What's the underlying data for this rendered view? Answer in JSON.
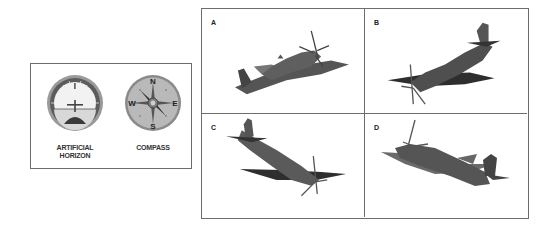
{
  "instruments": {
    "artificial_horizon": {
      "label": "ARTIFICIAL HORIZON",
      "label_line1": "ARTIFICIAL",
      "label_line2": "HORIZON",
      "icon": "artificial-horizon-icon"
    },
    "compass": {
      "label": "COMPASS",
      "icon": "compass-icon",
      "directions": {
        "n": "N",
        "e": "E",
        "s": "S",
        "w": "W"
      }
    }
  },
  "options": [
    {
      "label": "A",
      "icon": "airplane-icon",
      "attitude": "nose up, banked"
    },
    {
      "label": "B",
      "icon": "airplane-icon",
      "attitude": "nose down, banked"
    },
    {
      "label": "C",
      "icon": "airplane-icon",
      "attitude": "nose down, banked"
    },
    {
      "label": "D",
      "icon": "airplane-icon",
      "attitude": "nose up, banked"
    }
  ],
  "colors": {
    "border": "#6d6d6d",
    "plane_body": "#5a5a5a",
    "plane_dark": "#2f2f2f",
    "instrument_bezel": "#8a8a8a"
  }
}
